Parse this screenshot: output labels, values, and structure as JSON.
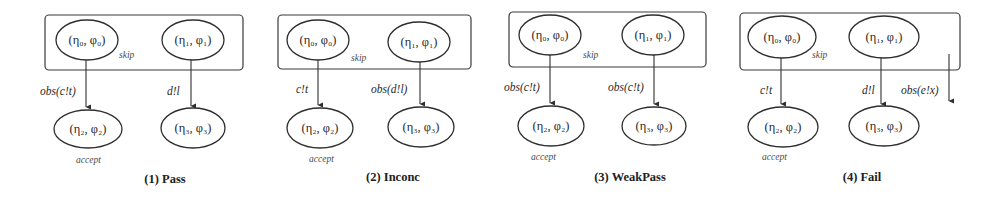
{
  "figure": {
    "panels": [
      {
        "caption": "(1) Pass",
        "box": {
          "x": 45,
          "y": 15,
          "w": 198,
          "h": 55
        },
        "skip_label": "skip",
        "skip_pos": [
          119,
          58
        ],
        "nodes": [
          {
            "id": "n0",
            "label": "(η₀, φ₀)",
            "cx": 87,
            "cy": 40,
            "rx": 31,
            "ry": 20
          },
          {
            "id": "n1",
            "label": "(η₁, φ₁)",
            "cx": 193,
            "cy": 40,
            "rx": 31,
            "ry": 20
          },
          {
            "id": "n2",
            "label": "(η₂, φ₂)",
            "cx": 88,
            "cy": 129,
            "rx": 34,
            "ry": 19
          },
          {
            "id": "n3",
            "label": "(η₃, φ₃)",
            "cx": 193,
            "cy": 128,
            "rx": 32,
            "ry": 20
          }
        ],
        "edges": [
          {
            "label": "obs(c!t)",
            "x": 86,
            "y1": 60,
            "y2": 109,
            "label_x": 40,
            "label_y": 95
          },
          {
            "label": "d!l",
            "x": 191,
            "y1": 60,
            "y2": 108,
            "label_x": 167,
            "label_y": 95
          }
        ],
        "accept_label": "accept",
        "accept_pos": [
          76,
          163
        ],
        "caption_pos": [
          165,
          183
        ]
      },
      {
        "caption": "(2) Inconc",
        "box": {
          "x": 278,
          "y": 15,
          "w": 193,
          "h": 54
        },
        "skip_label": "skip",
        "skip_pos": [
          351,
          61
        ],
        "nodes": [
          {
            "id": "n0",
            "label": "(η₀, φ₀)",
            "cx": 318,
            "cy": 40,
            "rx": 31,
            "ry": 20
          },
          {
            "id": "n1",
            "label": "(η₁, φ₁)",
            "cx": 419,
            "cy": 42,
            "rx": 31,
            "ry": 20
          },
          {
            "id": "n2",
            "label": "(η₂, φ₂)",
            "cx": 320,
            "cy": 128,
            "rx": 33,
            "ry": 20
          },
          {
            "id": "n3",
            "label": "(η₃, φ₃)",
            "cx": 421,
            "cy": 127,
            "rx": 33,
            "ry": 20
          }
        ],
        "edges": [
          {
            "label": "c!t",
            "x": 318,
            "y1": 60,
            "y2": 107,
            "label_x": 296,
            "label_y": 93
          },
          {
            "label": "obs(d!l)",
            "x": 420,
            "y1": 62,
            "y2": 106,
            "label_x": 371,
            "label_y": 93
          }
        ],
        "accept_label": "accept",
        "accept_pos": [
          309,
          162
        ],
        "caption_pos": [
          393,
          181
        ]
      },
      {
        "caption": "(3) WeakPass",
        "box": {
          "x": 509,
          "y": 12,
          "w": 197,
          "h": 55
        },
        "skip_label": "skip",
        "skip_pos": [
          583,
          58
        ],
        "nodes": [
          {
            "id": "n0",
            "label": "(η₀, φ₀)",
            "cx": 550,
            "cy": 35,
            "rx": 31,
            "ry": 20
          },
          {
            "id": "n1",
            "label": "(η₁, φ₁)",
            "cx": 653,
            "cy": 35,
            "rx": 31,
            "ry": 20
          },
          {
            "id": "n2",
            "label": "(η₂, φ₂)",
            "cx": 551,
            "cy": 126,
            "rx": 33,
            "ry": 20
          },
          {
            "id": "n3",
            "label": "(η₃, φ₃)",
            "cx": 654,
            "cy": 126,
            "rx": 32,
            "ry": 19
          },
          {
            "id": "n4",
            "label": "",
            "cx": 0,
            "cy": 0,
            "rx": 0,
            "ry": 0
          }
        ],
        "edges": [
          {
            "label": "obs(c!t)",
            "x": 550,
            "y1": 55,
            "y2": 105,
            "label_x": 504,
            "label_y": 91
          },
          {
            "label": "obs(c!t)",
            "x": 654,
            "y1": 55,
            "y2": 106,
            "label_x": 608,
            "label_y": 91
          }
        ],
        "accept_label": "accept",
        "accept_pos": [
          531,
          160
        ],
        "caption_pos": [
          630,
          181
        ]
      },
      {
        "caption": "(4) Fail",
        "box": {
          "x": 740,
          "y": 13,
          "w": 220,
          "h": 57
        },
        "skip_label": "skip",
        "skip_pos": [
          812,
          58
        ],
        "nodes": [
          {
            "id": "n0",
            "label": "(η₀, φ₀)",
            "cx": 782,
            "cy": 37,
            "rx": 34,
            "ry": 21
          },
          {
            "id": "n1",
            "label": "(η₁, φ₁)",
            "cx": 884,
            "cy": 37,
            "rx": 35,
            "ry": 21
          },
          {
            "id": "n2",
            "label": "(η₂, φ₂)",
            "cx": 783,
            "cy": 127,
            "rx": 35,
            "ry": 20
          },
          {
            "id": "n3",
            "label": "(η₃, φ₃)",
            "cx": 884,
            "cy": 126,
            "rx": 35,
            "ry": 20
          }
        ],
        "edges": [
          {
            "label": "c!t",
            "x": 781,
            "y1": 58,
            "y2": 106,
            "label_x": 760,
            "label_y": 94
          },
          {
            "label": "d!l",
            "x": 881,
            "y1": 58,
            "y2": 106,
            "label_x": 862,
            "label_y": 94
          },
          {
            "label": "obs(e!x)",
            "x": 949,
            "y1": 54,
            "y2": 103,
            "label_x": 901,
            "label_y": 94
          }
        ],
        "accept_label": "accept",
        "accept_pos": [
          762,
          160
        ],
        "caption_pos": [
          862,
          181
        ]
      }
    ]
  }
}
